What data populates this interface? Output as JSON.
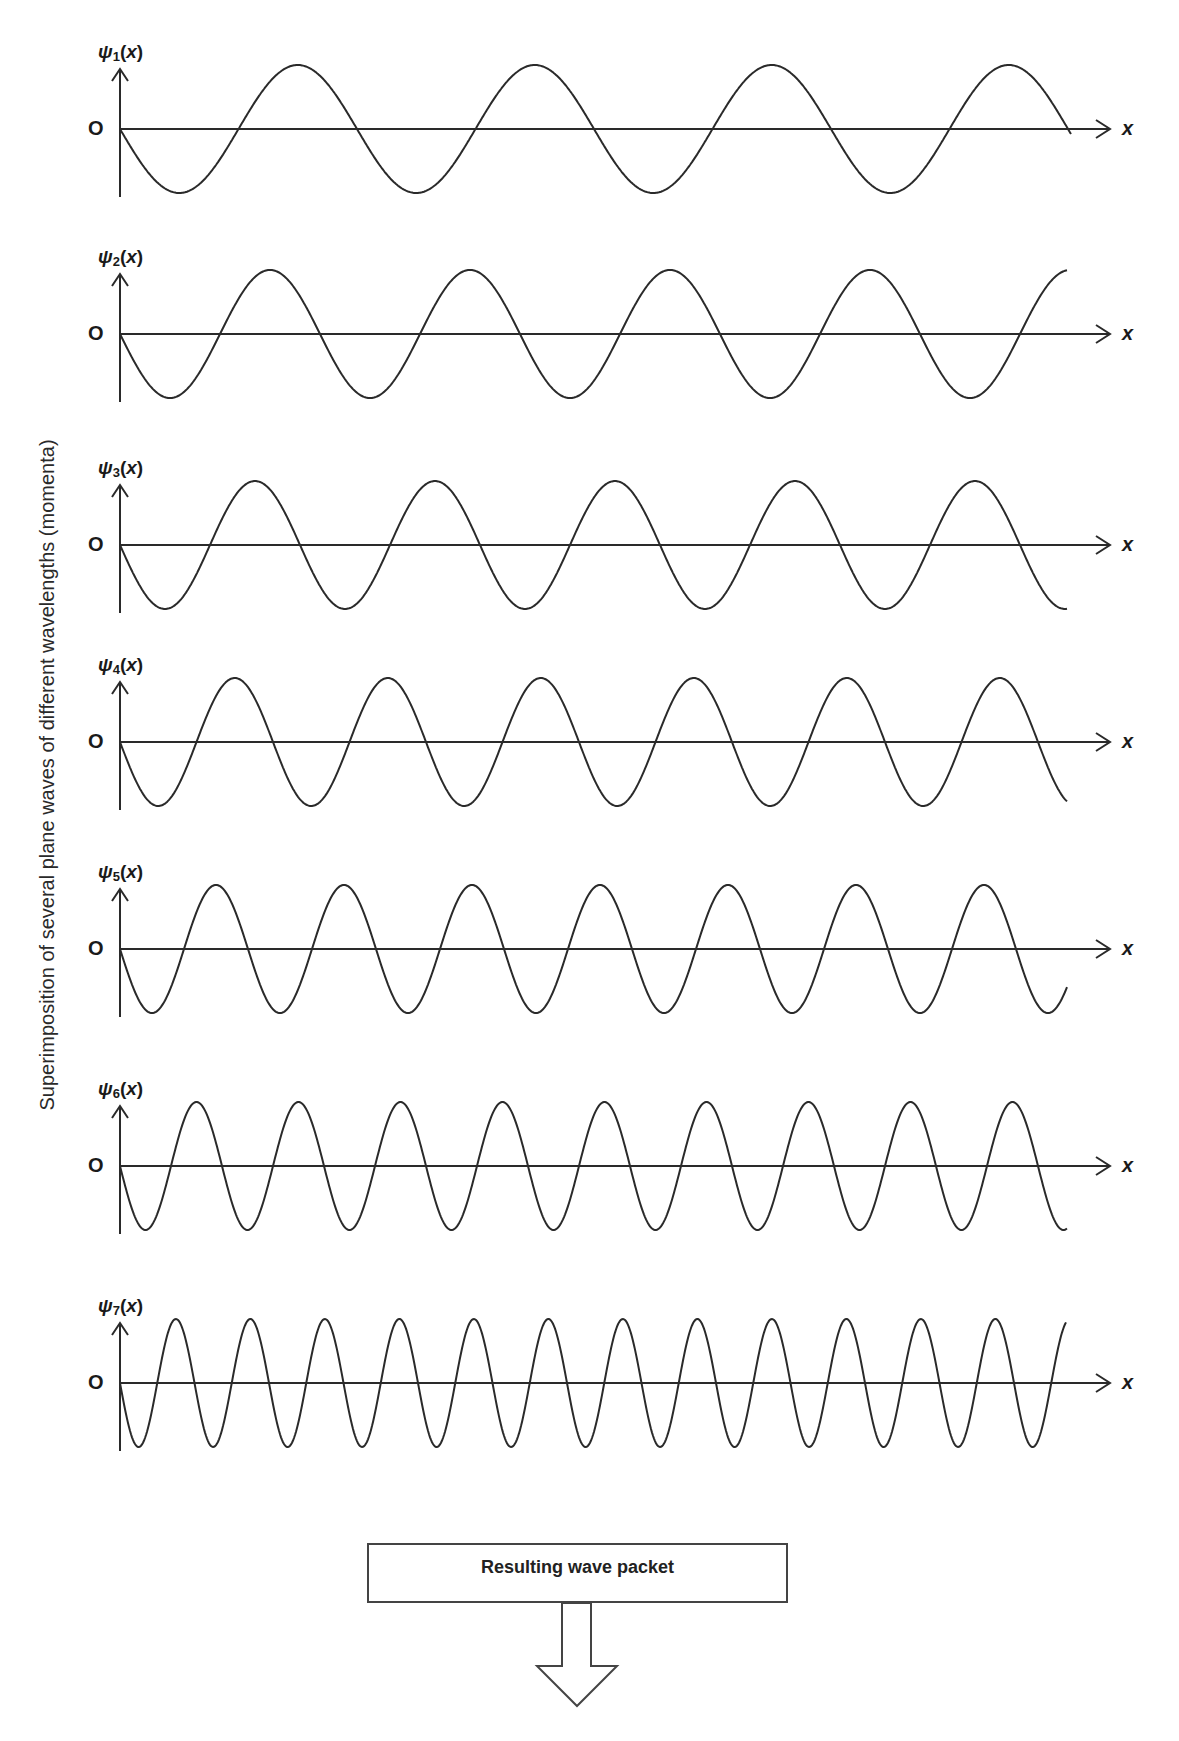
{
  "diagram": {
    "side_label": "Superimposition of several plane waves of different wavelengths (momenta)",
    "origin_label": "O",
    "x_axis_label": "x",
    "result_box_label": "Resulting wave packet",
    "line_color": "#2a2a2a"
  },
  "chart_data": {
    "type": "line",
    "title": "Superimposition of several plane waves of different wavelengths (momenta)",
    "xlabel": "x",
    "ylabel": "ψn(x)",
    "grid": false,
    "series": [
      {
        "name": "ψ1(x)",
        "label_main": "ψ",
        "label_sub": "1",
        "axis_y_px": 129,
        "period_px": 237,
        "amplitude_px": 64,
        "end_x_px": 1071,
        "phase": "starts at O going negative"
      },
      {
        "name": "ψ2(x)",
        "label_main": "ψ",
        "label_sub": "2",
        "axis_y_px": 334,
        "period_px": 200,
        "amplitude_px": 64,
        "end_x_px": 1067,
        "phase": "starts at O going negative"
      },
      {
        "name": "ψ3(x)",
        "label_main": "ψ",
        "label_sub": "3",
        "axis_y_px": 545,
        "period_px": 180,
        "amplitude_px": 64,
        "end_x_px": 1067,
        "phase": "starts at O going negative"
      },
      {
        "name": "ψ4(x)",
        "label_main": "ψ",
        "label_sub": "4",
        "axis_y_px": 742,
        "period_px": 153,
        "amplitude_px": 64,
        "end_x_px": 1067,
        "phase": "starts at O going negative"
      },
      {
        "name": "ψ5(x)",
        "label_main": "ψ",
        "label_sub": "5",
        "axis_y_px": 949,
        "period_px": 128,
        "amplitude_px": 64,
        "end_x_px": 1067,
        "phase": "starts at O going negative"
      },
      {
        "name": "ψ6(x)",
        "label_main": "ψ",
        "label_sub": "6",
        "axis_y_px": 1166,
        "period_px": 102,
        "amplitude_px": 64,
        "end_x_px": 1067,
        "phase": "starts at O going negative"
      },
      {
        "name": "ψ7(x)",
        "label_main": "ψ",
        "label_sub": "7",
        "axis_y_px": 1383,
        "period_px": 74.5,
        "amplitude_px": 64,
        "end_x_px": 1066,
        "phase": "starts at O going negative"
      }
    ],
    "layout": {
      "origin_x_px": 120,
      "axis_end_x_px": 1110
    },
    "annotations": [
      "Resulting wave packet (downward arrow)"
    ]
  }
}
